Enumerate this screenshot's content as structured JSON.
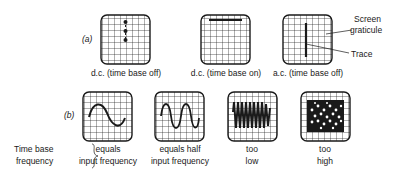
{
  "row_a": {
    "label": "(a)",
    "screens": [
      {
        "caption": "d.c. (time base off)",
        "trace": "dots-vertical"
      },
      {
        "caption": "d.c. (time base on)",
        "trace": "horizontal-line"
      },
      {
        "caption": "a.c. (time base off)",
        "trace": "vertical-line"
      }
    ],
    "annotations": {
      "screen_graticule_line1": "Screen",
      "screen_graticule_line2": "graticule",
      "trace": "Trace"
    }
  },
  "row_b": {
    "label": "(b)",
    "side_label_line1": "Time base",
    "side_label_line2": "frequency",
    "screens": [
      {
        "caption_line1": "equals",
        "caption_line2": "input frequency",
        "trace": "one-cycle-sine"
      },
      {
        "caption_line1": "equals half",
        "caption_line2": "input frequency",
        "trace": "two-cycle-sine"
      },
      {
        "caption_line1": "too",
        "caption_line2": "low",
        "trace": "many-cycles"
      },
      {
        "caption_line1": "too",
        "caption_line2": "high",
        "trace": "mesh"
      }
    ]
  },
  "colors": {
    "ink": "#1a1a1a",
    "background": "#ffffff"
  }
}
